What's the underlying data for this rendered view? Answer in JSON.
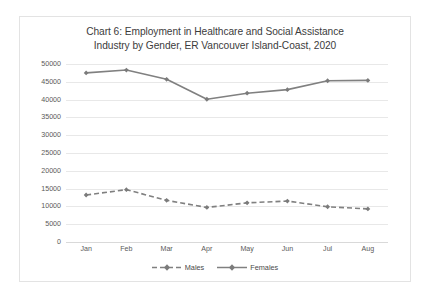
{
  "chart_data": {
    "type": "line",
    "title": "Chart 6: Employment in Healthcare and Social Assistance Industry by Gender, ER Vancouver Island-Coast, 2020",
    "title_lines": [
      "Chart 6: Employment in Healthcare and Social Assistance",
      "Industry by Gender, ER Vancouver Island-Coast, 2020"
    ],
    "xlabel": "",
    "ylabel": "",
    "categories": [
      "Jan",
      "Feb",
      "Mar",
      "Apr",
      "May",
      "Jun",
      "Jul",
      "Aug"
    ],
    "ylim": [
      0,
      50000
    ],
    "ytick_step": 5000,
    "ytick_labels": [
      "0",
      "5000",
      "10000",
      "15000",
      "20000",
      "25000",
      "30000",
      "35000",
      "40000",
      "45000",
      "50000"
    ],
    "ytick_values": [
      0,
      5000,
      10000,
      15000,
      20000,
      25000,
      30000,
      35000,
      40000,
      45000,
      50000
    ],
    "grid": true,
    "legend_position": "bottom",
    "series": [
      {
        "name": "Males",
        "style": "dashed",
        "color": "#808080",
        "marker": "diamond",
        "values": [
          13200,
          14700,
          11700,
          9700,
          11000,
          11500,
          9900,
          9300
        ]
      },
      {
        "name": "Females",
        "style": "solid",
        "color": "#808080",
        "marker": "diamond",
        "values": [
          47500,
          48300,
          45700,
          40100,
          41800,
          42800,
          45300,
          45400
        ]
      }
    ]
  },
  "legend": {
    "males_label": "Males",
    "females_label": "Females"
  },
  "colors": {
    "series_line": "#808080",
    "gridline": "#e8e8e8",
    "axis": "#d9d9d9",
    "tick_text": "#5a5a5a",
    "title_text": "#3c3c3c",
    "card_border": "#e3e3e3",
    "background": "#ffffff"
  }
}
